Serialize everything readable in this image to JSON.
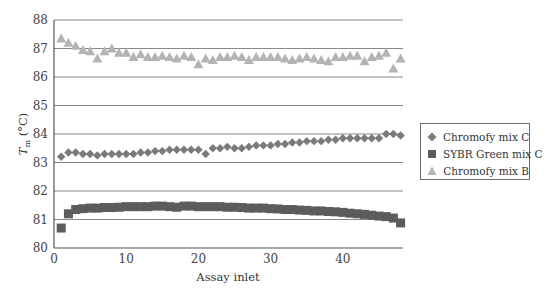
{
  "chart_data": {
    "type": "scatter",
    "title": "",
    "xlabel": "Assay inlet",
    "ylabel": "T_m (°C)",
    "ylabel_main": "T",
    "ylabel_sub": "m",
    "ylabel_unit": " (°C)",
    "xlim": [
      0,
      48
    ],
    "ylim": [
      80,
      88
    ],
    "x_ticks": [
      0,
      10,
      20,
      30,
      40
    ],
    "y_ticks": [
      80,
      81,
      82,
      83,
      84,
      85,
      86,
      87,
      88
    ],
    "grid": "horizontal",
    "legend_position": "right",
    "x": [
      1,
      2,
      3,
      4,
      5,
      6,
      7,
      8,
      9,
      10,
      11,
      12,
      13,
      14,
      15,
      16,
      17,
      18,
      19,
      20,
      21,
      22,
      23,
      24,
      25,
      26,
      27,
      28,
      29,
      30,
      31,
      32,
      33,
      34,
      35,
      36,
      37,
      38,
      39,
      40,
      41,
      42,
      43,
      44,
      45,
      46,
      47,
      48
    ],
    "series": [
      {
        "name": "Chromofy mix C",
        "marker": "diamond",
        "color": "#7a7a7a",
        "values": [
          83.2,
          83.35,
          83.35,
          83.3,
          83.3,
          83.25,
          83.3,
          83.3,
          83.3,
          83.3,
          83.3,
          83.35,
          83.35,
          83.4,
          83.4,
          83.45,
          83.45,
          83.45,
          83.45,
          83.45,
          83.3,
          83.5,
          83.5,
          83.55,
          83.5,
          83.5,
          83.55,
          83.6,
          83.6,
          83.6,
          83.65,
          83.65,
          83.7,
          83.7,
          83.75,
          83.75,
          83.75,
          83.8,
          83.8,
          83.85,
          83.85,
          83.85,
          83.85,
          83.85,
          83.85,
          84.0,
          84.0,
          83.95
        ]
      },
      {
        "name": "SYBR Green mix C",
        "marker": "square",
        "color": "#5c5c5c",
        "values": [
          80.7,
          81.2,
          81.35,
          81.38,
          81.4,
          81.4,
          81.42,
          81.42,
          81.43,
          81.45,
          81.45,
          81.45,
          81.45,
          81.47,
          81.47,
          81.45,
          81.43,
          81.47,
          81.47,
          81.45,
          81.45,
          81.45,
          81.45,
          81.43,
          81.43,
          81.42,
          81.4,
          81.4,
          81.4,
          81.38,
          81.37,
          81.35,
          81.35,
          81.33,
          81.32,
          81.3,
          81.3,
          81.28,
          81.27,
          81.25,
          81.22,
          81.2,
          81.18,
          81.15,
          81.12,
          81.1,
          81.05,
          80.88
        ]
      },
      {
        "name": "Chromofy mix B",
        "marker": "triangle",
        "color": "#b4b4b4",
        "values": [
          87.35,
          87.2,
          87.1,
          86.95,
          86.9,
          86.65,
          86.9,
          87.0,
          86.85,
          86.85,
          86.7,
          86.8,
          86.7,
          86.7,
          86.75,
          86.7,
          86.65,
          86.75,
          86.7,
          86.45,
          86.65,
          86.6,
          86.7,
          86.7,
          86.75,
          86.7,
          86.6,
          86.7,
          86.7,
          86.7,
          86.7,
          86.65,
          86.6,
          86.65,
          86.7,
          86.65,
          86.6,
          86.55,
          86.7,
          86.7,
          86.75,
          86.75,
          86.55,
          86.7,
          86.75,
          86.85,
          86.3,
          86.65
        ]
      }
    ]
  },
  "legend": {
    "items": [
      {
        "label": "Chromofy mix C"
      },
      {
        "label": "SYBR Green mix C"
      },
      {
        "label": "Chromofy mix B"
      }
    ]
  },
  "style": {
    "axis_color": "#555555",
    "grid_color": "#888888"
  }
}
